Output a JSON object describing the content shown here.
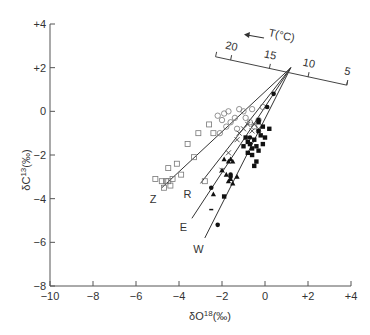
{
  "chart_data": {
    "type": "scatter",
    "title": "",
    "xlabel": "δO18(‰)",
    "ylabel": "δC13(‰)",
    "xlim": [
      -10,
      4
    ],
    "ylim": [
      -8,
      4
    ],
    "x_ticks": [
      "−10",
      "−8",
      "−6",
      "−4",
      "−2",
      "0",
      "+2",
      "+4"
    ],
    "x_tick_values": [
      -10,
      -8,
      -6,
      -4,
      -2,
      0,
      2,
      4
    ],
    "y_ticks": [
      "+4",
      "+2",
      "0",
      "−2",
      "−4",
      "−6",
      "−8"
    ],
    "y_tick_values": [
      4,
      2,
      0,
      -2,
      -4,
      -6,
      -8
    ],
    "grid": false,
    "convergence_point": [
      1.2,
      2.0
    ],
    "trend_lines": [
      {
        "label": "Z",
        "from": [
          1.2,
          2.0
        ],
        "to": [
          -4.8,
          -3.5
        ],
        "label_pos": [
          -5.2,
          -4.0
        ]
      },
      {
        "label": "R",
        "from": [
          1.2,
          2.0
        ],
        "to": [
          -3.0,
          -3.3
        ],
        "label_pos": [
          -3.6,
          -3.8
        ]
      },
      {
        "label": "E",
        "from": [
          1.2,
          2.0
        ],
        "to": [
          -3.4,
          -4.9
        ],
        "label_pos": [
          -3.8,
          -5.3
        ]
      },
      {
        "label": "W",
        "from": [
          1.2,
          2.0
        ],
        "to": [
          -2.8,
          -5.8
        ],
        "label_pos": [
          -3.1,
          -6.3
        ]
      }
    ],
    "temperature_scale": {
      "label": "T(°C)",
      "arrow_direction": "toward higher T (left)",
      "from": [
        -2.3,
        2.5
      ],
      "to": [
        3.8,
        1.2
      ],
      "ticks": [
        {
          "label": "20",
          "pos": [
            -1.6,
            2.35
          ]
        },
        {
          "label": "15",
          "pos": [
            0.2,
            1.95
          ]
        },
        {
          "label": "10",
          "pos": [
            2.0,
            1.57
          ]
        },
        {
          "label": "5",
          "pos": [
            3.8,
            1.2
          ]
        }
      ]
    },
    "series": [
      {
        "name": "open squares",
        "marker": "open-square",
        "points": [
          [
            -5.1,
            -3.1
          ],
          [
            -4.8,
            -3.2
          ],
          [
            -4.6,
            -3.2
          ],
          [
            -4.5,
            -3.2
          ],
          [
            -4.4,
            -3.4
          ],
          [
            -4.3,
            -3.1
          ],
          [
            -4.1,
            -2.4
          ],
          [
            -4.5,
            -2.6
          ],
          [
            -3.6,
            -1.5
          ],
          [
            -3.3,
            -2.1
          ],
          [
            -3.1,
            -1.0
          ],
          [
            -2.6,
            -0.6
          ],
          [
            -2.4,
            -1.0
          ],
          [
            -4.7,
            -3.5
          ],
          [
            -3.9,
            -2.9
          ],
          [
            -2.8,
            -3.2
          ]
        ]
      },
      {
        "name": "open circles",
        "marker": "open-circle",
        "points": [
          [
            -2.2,
            -0.2
          ],
          [
            -2.0,
            -0.4
          ],
          [
            -1.9,
            -0.1
          ],
          [
            -1.7,
            0.0
          ],
          [
            -1.6,
            -0.5
          ],
          [
            -1.4,
            -0.3
          ],
          [
            -1.2,
            0.1
          ],
          [
            -1.0,
            0.0
          ],
          [
            -0.9,
            -0.3
          ],
          [
            -0.7,
            -0.5
          ],
          [
            -0.6,
            0.1
          ],
          [
            -0.3,
            -0.4
          ],
          [
            -0.1,
            0.2
          ],
          [
            -1.8,
            -0.7
          ],
          [
            -2.1,
            -1.0
          ],
          [
            -1.3,
            -0.8
          ],
          [
            -0.5,
            -0.7
          ]
        ]
      },
      {
        "name": "crosses",
        "marker": "cross",
        "points": [
          [
            -1.0,
            -0.8
          ],
          [
            -0.8,
            -0.6
          ],
          [
            -0.6,
            -0.9
          ],
          [
            -0.5,
            -0.6
          ],
          [
            -1.3,
            -1.3
          ],
          [
            -1.7,
            -1.9
          ],
          [
            -2.0,
            -2.7
          ],
          [
            -1.2,
            -1.0
          ],
          [
            -0.3,
            -0.8
          ]
        ]
      },
      {
        "name": "filled squares",
        "marker": "filled-square",
        "points": [
          [
            -0.9,
            -1.2
          ],
          [
            -0.8,
            -1.4
          ],
          [
            -0.7,
            -1.5
          ],
          [
            -0.6,
            -1.7
          ],
          [
            -0.5,
            -1.3
          ],
          [
            -0.4,
            -1.6
          ],
          [
            -0.3,
            -1.8
          ],
          [
            -0.2,
            -1.1
          ],
          [
            -0.1,
            -1.5
          ],
          [
            -0.6,
            -2.0
          ],
          [
            -0.4,
            -2.3
          ],
          [
            -0.8,
            -1.9
          ],
          [
            -0.3,
            -0.9
          ],
          [
            -0.1,
            -0.7
          ],
          [
            0.0,
            -1.2
          ],
          [
            -0.5,
            -2.5
          ],
          [
            -1.0,
            -1.6
          ],
          [
            -1.9,
            -3.9
          ],
          [
            -0.3,
            -0.5
          ],
          [
            0.2,
            -0.8
          ]
        ]
      },
      {
        "name": "filled circles",
        "marker": "filled-circle",
        "points": [
          [
            0.4,
            0.8
          ],
          [
            0.1,
            0.2
          ],
          [
            -0.3,
            -0.4
          ],
          [
            -1.6,
            -2.9
          ],
          [
            -1.6,
            -3.0
          ],
          [
            -2.5,
            -3.5
          ],
          [
            -2.2,
            -5.2
          ],
          [
            -0.7,
            -1.2
          ]
        ]
      },
      {
        "name": "filled triangles",
        "marker": "filled-triangle",
        "points": [
          [
            -1.9,
            -2.2
          ],
          [
            -1.7,
            -2.3
          ],
          [
            -1.6,
            -2.2
          ],
          [
            -1.5,
            -2.3
          ],
          [
            -2.0,
            -2.7
          ],
          [
            -1.8,
            -2.9
          ],
          [
            -1.6,
            -3.1
          ],
          [
            -1.5,
            -3.3
          ],
          [
            -1.3,
            -3.0
          ],
          [
            -1.7,
            -3.2
          ],
          [
            -2.4,
            -3.8
          ]
        ]
      },
      {
        "name": "dashes",
        "marker": "dash",
        "points": [
          [
            -2.5,
            -4.5
          ]
        ]
      }
    ],
    "annotations": [
      "Z",
      "R",
      "E",
      "W",
      "T(°C)",
      "20",
      "15",
      "10",
      "5"
    ]
  }
}
